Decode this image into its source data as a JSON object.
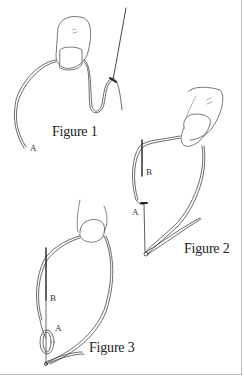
{
  "figures": [
    {
      "caption": "Figure 1",
      "labels": {
        "a": "A"
      }
    },
    {
      "caption": "Figure 2",
      "labels": {
        "a": "A",
        "b": "B"
      }
    },
    {
      "caption": "Figure 3",
      "labels": {
        "a": "A",
        "b": "B"
      }
    }
  ],
  "colors": {
    "line": "#333333",
    "border": "#bcbcbc",
    "background": "#ffffff"
  }
}
